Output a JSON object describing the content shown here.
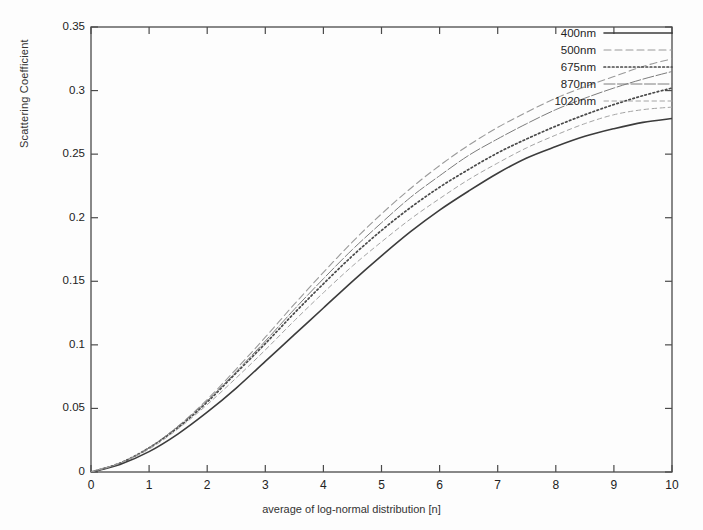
{
  "chart_data": {
    "type": "line",
    "title": "",
    "subtitle": "",
    "xlabel": "average of log-normal distribution [n]",
    "ylabel": "Scattering Coefficient",
    "xlim": [
      0,
      10
    ],
    "ylim": [
      0,
      0.35
    ],
    "grid": false,
    "legend_position": "top-right inside axes",
    "xticks": [
      "0",
      "1",
      "2",
      "3",
      "4",
      "5",
      "6",
      "7",
      "8",
      "9",
      "10"
    ],
    "yticks": [
      "0",
      "0.05",
      "0.1",
      "0.15",
      "0.2",
      "0.25",
      "0.3",
      "0.35"
    ],
    "xtick_values": [
      0,
      1,
      2,
      3,
      4,
      5,
      6,
      7,
      8,
      9,
      10
    ],
    "ytick_values": [
      0,
      0.05,
      0.1,
      0.15,
      0.2,
      0.25,
      0.3,
      0.35
    ],
    "x": [
      0,
      0.5,
      1,
      1.5,
      2,
      2.5,
      3,
      3.5,
      4,
      4.5,
      5,
      5.5,
      6,
      6.5,
      7,
      7.5,
      8,
      8.5,
      9,
      9.5,
      10
    ],
    "series": [
      {
        "name": "400nm",
        "style": "solid",
        "color": "#3c3c3c",
        "width": 1.6,
        "values": [
          0,
          0.006,
          0.016,
          0.03,
          0.047,
          0.066,
          0.087,
          0.108,
          0.129,
          0.15,
          0.17,
          0.189,
          0.206,
          0.221,
          0.235,
          0.247,
          0.256,
          0.264,
          0.27,
          0.275,
          0.278
        ]
      },
      {
        "name": "500nm",
        "style": "dashed",
        "color": "#9a9a9a",
        "width": 1.1,
        "values": [
          0,
          0.007,
          0.019,
          0.036,
          0.057,
          0.081,
          0.106,
          0.132,
          0.157,
          0.181,
          0.203,
          0.223,
          0.241,
          0.257,
          0.271,
          0.283,
          0.294,
          0.303,
          0.311,
          0.319,
          0.325
        ]
      },
      {
        "name": "675nm",
        "style": "dotted-bold",
        "color": "#4a4a4a",
        "width": 1.7,
        "values": [
          0,
          0.007,
          0.019,
          0.035,
          0.055,
          0.078,
          0.101,
          0.125,
          0.148,
          0.17,
          0.19,
          0.208,
          0.224,
          0.238,
          0.251,
          0.262,
          0.272,
          0.281,
          0.289,
          0.296,
          0.302
        ]
      },
      {
        "name": "870nm",
        "style": "fine-solid",
        "color": "#7c7c7c",
        "width": 1.0,
        "values": [
          0,
          0.007,
          0.019,
          0.036,
          0.056,
          0.079,
          0.103,
          0.128,
          0.152,
          0.175,
          0.196,
          0.216,
          0.233,
          0.249,
          0.262,
          0.274,
          0.285,
          0.294,
          0.302,
          0.309,
          0.315
        ]
      },
      {
        "name": "1020nm",
        "style": "fine-dashed",
        "color": "#a4a4a4",
        "width": 1.0,
        "values": [
          0,
          0.007,
          0.018,
          0.034,
          0.053,
          0.074,
          0.096,
          0.119,
          0.141,
          0.162,
          0.181,
          0.199,
          0.215,
          0.23,
          0.243,
          0.255,
          0.265,
          0.274,
          0.281,
          0.285,
          0.287
        ]
      }
    ]
  },
  "axes": {
    "frame_color": "#4b4b4b"
  },
  "legend": {
    "entries": [
      {
        "label": "400nm"
      },
      {
        "label": "500nm"
      },
      {
        "label": "675nm"
      },
      {
        "label": "870nm"
      },
      {
        "label": "1020nm"
      }
    ]
  }
}
